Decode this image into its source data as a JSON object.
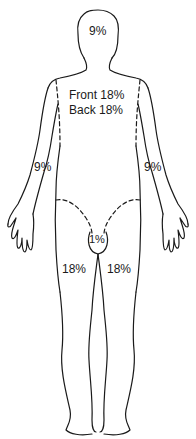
{
  "regions": {
    "head": {
      "label": "9%"
    },
    "trunk_front": {
      "label": "Front 18%"
    },
    "trunk_back": {
      "label": "Back 18%"
    },
    "right_arm": {
      "label": "9%"
    },
    "left_arm": {
      "label": "9%"
    },
    "perineum": {
      "label": "1%"
    },
    "right_leg": {
      "label": "18%"
    },
    "left_leg": {
      "label": "18%"
    }
  },
  "colors": {
    "outline": "#1a1a1a",
    "background": "#ffffff"
  }
}
